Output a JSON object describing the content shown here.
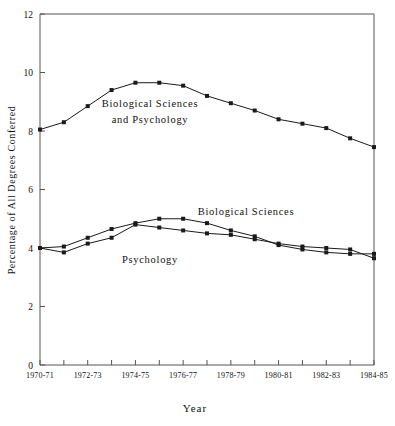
{
  "chart_data": {
    "type": "line",
    "title": "",
    "xlabel": "Year",
    "ylabel": "Percentage of All Degrees Conferred",
    "ylim": [
      0,
      12
    ],
    "yticks": [
      0,
      2,
      4,
      6,
      8,
      10,
      12
    ],
    "ytick_labels": [
      "0",
      "2",
      "4",
      "6",
      "8",
      "10",
      "12"
    ],
    "grid": false,
    "legend_position": "inline-annotations",
    "categories": [
      "1970-71",
      "1971-72",
      "1972-73",
      "1973-74",
      "1974-75",
      "1975-76",
      "1976-77",
      "1977-78",
      "1978-79",
      "1979-80",
      "1980-81",
      "1981-82",
      "1982-83",
      "1983-84",
      "1984-85"
    ],
    "xtick_labels": [
      "1970-71",
      "1972-73",
      "1974-75",
      "1976-77",
      "1978-79",
      "1980-81",
      "1982-83",
      "1984-85"
    ],
    "series": [
      {
        "name": "Biological Sciences and Psychology",
        "values": [
          8.05,
          8.3,
          8.85,
          9.4,
          9.65,
          9.65,
          9.55,
          9.2,
          8.95,
          8.7,
          8.4,
          8.25,
          8.1,
          7.75,
          7.45
        ]
      },
      {
        "name": "Biological Sciences",
        "values": [
          4.0,
          4.05,
          4.35,
          4.65,
          4.85,
          5.0,
          5.0,
          4.85,
          4.6,
          4.4,
          4.1,
          3.95,
          3.85,
          3.8,
          3.8
        ]
      },
      {
        "name": "Psychology",
        "values": [
          4.0,
          3.85,
          4.15,
          4.35,
          4.8,
          4.7,
          4.6,
          4.5,
          4.45,
          4.3,
          4.15,
          4.05,
          4.0,
          3.95,
          3.65
        ]
      }
    ],
    "annotations": [
      {
        "id": "annot-combined",
        "lines": [
          "Biological Sciences",
          "and Psychology"
        ],
        "x": 150,
        "y": 107
      },
      {
        "id": "annot-biological",
        "lines": [
          "Biological Sciences"
        ],
        "x": 246,
        "y": 215
      },
      {
        "id": "annot-psychology",
        "lines": [
          "Psychology"
        ],
        "x": 150,
        "y": 263
      }
    ],
    "colors": {
      "line": "#1a1a1a",
      "axis": "#555555",
      "background": "#ffffff",
      "marker": "#1a1a1a"
    }
  },
  "geometry": {
    "plot_left": 40,
    "plot_right": 374,
    "plot_top": 14,
    "plot_bottom": 365
  }
}
